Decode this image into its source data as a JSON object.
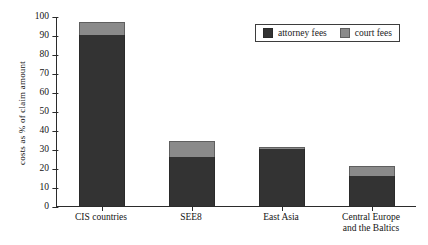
{
  "chart_data": {
    "type": "bar",
    "stacked": true,
    "title": "",
    "xlabel": "",
    "ylabel": "costs as % of claim amount",
    "ylim": [
      0,
      100
    ],
    "ytick_step": 10,
    "yticks": [
      0,
      10,
      20,
      30,
      40,
      50,
      60,
      70,
      80,
      90,
      100
    ],
    "grid": false,
    "legend_position": "top-right",
    "categories": [
      "CIS countries",
      "SEE8",
      "East Asia",
      "Central Europe and the Baltics"
    ],
    "category_lines": [
      [
        "CIS countries"
      ],
      [
        "SEE8"
      ],
      [
        "East Asia"
      ],
      [
        "Central Europe",
        "and the Baltics"
      ]
    ],
    "series": [
      {
        "name": "attorney fees",
        "color": "#333333",
        "values": [
          90,
          26,
          30,
          16
        ]
      },
      {
        "name": "court fees",
        "color": "#8a8a8a",
        "values": [
          7,
          8,
          1,
          5
        ]
      }
    ],
    "totals": [
      97,
      34,
      31,
      21
    ]
  },
  "legend": {
    "items": [
      {
        "label": "attorney fees",
        "swatch": "legend-swatch-attorney-fees"
      },
      {
        "label": "court fees",
        "swatch": "legend-swatch-court-fees"
      }
    ]
  },
  "axis": {
    "y_title": "costs as % of claim amount"
  }
}
